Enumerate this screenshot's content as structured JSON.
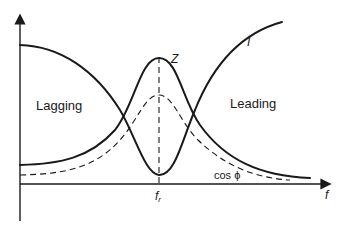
{
  "diagram": {
    "labels": {
      "lagging": "Lagging",
      "leading": "Leading",
      "impedance": "Z",
      "current": "I",
      "power_factor": "cos ϕ",
      "resonant_frequency_main": "f",
      "resonant_frequency_sub": "r",
      "x_axis": "f"
    },
    "curves": [
      {
        "name": "Z",
        "style": "solid",
        "shape": "bell",
        "behavior": "maximum at resonant frequency"
      },
      {
        "name": "I",
        "style": "solid",
        "shape": "U",
        "behavior": "minimum at resonant frequency"
      },
      {
        "name": "cos ϕ",
        "style": "dashed",
        "shape": "bell",
        "behavior": "maximum at resonant frequency"
      }
    ],
    "marker": {
      "name": "f_r",
      "style": "dashed vertical line"
    },
    "colors": {
      "ink": "#1a1a1a",
      "background": "#ffffff"
    }
  }
}
